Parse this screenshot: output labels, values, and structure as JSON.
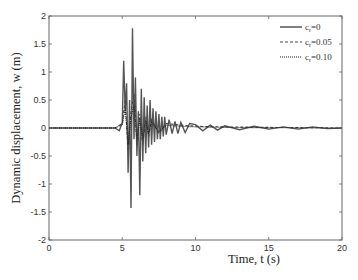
{
  "chart_data": {
    "type": "line",
    "title": "",
    "xlabel": "Time, t (s)",
    "ylabel": "Dynamic displacement, w (m)",
    "xlim": [
      0,
      20
    ],
    "ylim": [
      -2,
      2
    ],
    "xticks": [
      0,
      5,
      10,
      15,
      20
    ],
    "xtick_labels": [
      "0",
      "5",
      "10",
      "15",
      "20"
    ],
    "yticks": [
      -2,
      -1.5,
      -1,
      -0.5,
      0,
      0.5,
      1,
      1.5,
      2
    ],
    "ytick_labels": [
      "-2",
      "-1.5",
      "-1",
      "-0.5",
      "0",
      "0.5",
      "1",
      "1.5",
      "2"
    ],
    "grid": false,
    "legend_position": "upper right",
    "series": [
      {
        "name": "c_r=0",
        "style": "solid",
        "color": "#555555",
        "x": [
          0,
          4.5,
          4.8,
          5.0,
          5.1,
          5.2,
          5.3,
          5.4,
          5.5,
          5.6,
          5.7,
          5.8,
          5.9,
          6.0,
          6.1,
          6.2,
          6.3,
          6.4,
          6.5,
          6.6,
          6.7,
          6.8,
          6.9,
          7.0,
          7.1,
          7.2,
          7.3,
          7.4,
          7.5,
          7.6,
          7.7,
          7.8,
          7.9,
          8.0,
          8.2,
          8.4,
          8.6,
          8.8,
          9.0,
          9.3,
          9.6,
          10.0,
          10.5,
          11.0,
          11.5,
          12.0,
          13.0,
          14.0,
          15.0,
          16.0,
          17.0,
          18.0,
          19.0,
          20.0
        ],
        "y": [
          0,
          0,
          -0.05,
          0.1,
          1.2,
          0.3,
          0.8,
          -0.8,
          0.5,
          -1.43,
          1.78,
          -0.2,
          0.9,
          -0.5,
          0.3,
          -1.2,
          0.7,
          -0.6,
          0.55,
          -0.45,
          0.4,
          -0.35,
          0.5,
          -0.3,
          0.35,
          -0.25,
          0.3,
          -0.2,
          0.25,
          -0.2,
          0.2,
          -0.15,
          0.2,
          -0.12,
          0.15,
          -0.1,
          0.12,
          -0.1,
          0.1,
          -0.08,
          0.08,
          0.06,
          -0.05,
          0.05,
          -0.04,
          0.04,
          -0.03,
          0.03,
          -0.02,
          0.02,
          -0.02,
          0.02,
          -0.01,
          0
        ]
      },
      {
        "name": "c_r=0.05",
        "style": "dashed",
        "color": "#444444",
        "x": [
          0,
          4.5,
          5.0,
          5.2,
          5.4,
          5.6,
          5.8,
          6.0,
          6.2,
          6.4,
          6.6,
          6.8,
          7.0,
          7.5,
          8.0,
          9.0,
          10.0,
          12.0,
          15.0,
          20.0
        ],
        "y": [
          0,
          0,
          0.08,
          0.5,
          -0.4,
          0.3,
          0.6,
          -0.3,
          0.25,
          -0.3,
          0.2,
          -0.15,
          0.15,
          -0.1,
          0.08,
          0.05,
          0.03,
          0.02,
          0.01,
          0
        ]
      },
      {
        "name": "c_r=0.10",
        "style": "dotted",
        "color": "#222222",
        "x": [
          0,
          4.5,
          5.0,
          5.2,
          5.4,
          5.6,
          5.8,
          6.0,
          6.2,
          6.4,
          6.6,
          6.8,
          7.0,
          7.5,
          8.0,
          9.0,
          10.0,
          12.0,
          15.0,
          20.0
        ],
        "y": [
          0,
          0,
          0.06,
          0.35,
          -0.3,
          0.2,
          0.4,
          -0.2,
          0.15,
          -0.2,
          0.12,
          -0.1,
          0.1,
          -0.06,
          0.05,
          0.03,
          0.02,
          0.01,
          0.005,
          0
        ]
      }
    ]
  },
  "legend": {
    "items": [
      {
        "prefix": "c",
        "sub": "r",
        "suffix": "=0"
      },
      {
        "prefix": "c",
        "sub": "r",
        "suffix": "=0.05"
      },
      {
        "prefix": "c",
        "sub": "r",
        "suffix": "=0.10"
      }
    ]
  }
}
